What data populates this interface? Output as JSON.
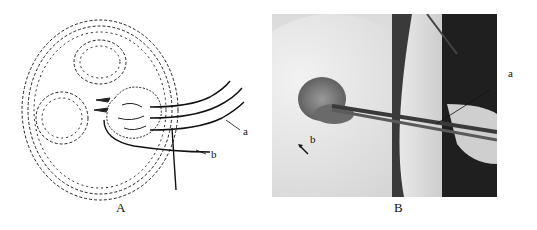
{
  "figure": {
    "panels": [
      {
        "id": "A",
        "caption": "A",
        "kind": "line-drawing",
        "labels": {
          "a": "a",
          "b": "b"
        }
      },
      {
        "id": "B",
        "caption": "B",
        "kind": "photograph",
        "labels": {
          "a": "a",
          "b": "b"
        }
      }
    ]
  }
}
